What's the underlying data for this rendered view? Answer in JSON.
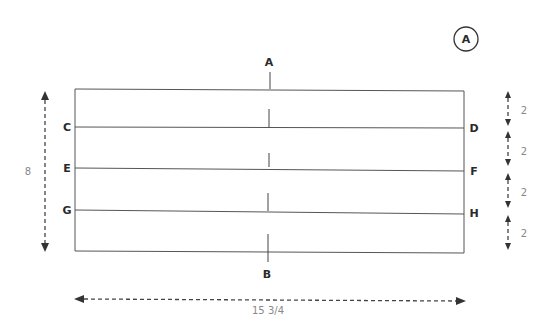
{
  "badge": {
    "label": "A"
  },
  "labels": {
    "top_center": "A",
    "bottom_center": "B",
    "left": [
      "C",
      "E",
      "G"
    ],
    "right": [
      "D",
      "F",
      "H"
    ]
  },
  "dimensions": {
    "height": "8",
    "width": "15 3/4",
    "segments": [
      "2",
      "2",
      "2",
      "2"
    ]
  },
  "colors": {
    "line": "#555555",
    "label": "#2a2a2a",
    "dimension_text": "#888888"
  }
}
